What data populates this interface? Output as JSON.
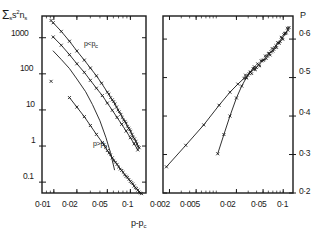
{
  "figure": {
    "type": "scientific-figure",
    "panels": 2,
    "background": "#ffffff",
    "ink": "#1a1a1a"
  },
  "left_panel": {
    "ylabel_sigma": "Σ",
    "ylabel_sigma_sub": "s",
    "ylabel_rest": "s",
    "ylabel_sup": "2",
    "ylabel_n": "n",
    "ylabel_n_sub": "s",
    "ylabel_full": "Σs s²nₛ",
    "xlabel": "p-p",
    "xlabel_sub": "c",
    "y_ticks": [
      "1000",
      "100",
      "10",
      "1",
      "0.1"
    ],
    "x_ticks": [
      "0·01",
      "0·02",
      "0·05",
      "0·1"
    ],
    "annotations": [
      "p<p",
      "p>p"
    ],
    "annotation_sub": "c",
    "annotation_low_label": "p<p",
    "annotation_high_label": "p>p"
  },
  "right_panel": {
    "ylabel": "P",
    "y_ticks": [
      "0·6",
      "0·5",
      "0·4",
      "0·3",
      "0·2"
    ],
    "x_ticks": [
      "0·002",
      "0·005",
      "0·02",
      "0·05",
      "0·1"
    ]
  },
  "chart_data": [
    {
      "type": "scatter",
      "panel": "left",
      "title": "",
      "xlabel": "p-p_c",
      "ylabel": "Σ_s s² n_s",
      "xscale": "log",
      "yscale": "log",
      "xlim": [
        0.007,
        0.16
      ],
      "ylim": [
        0.05,
        4000
      ],
      "x_ticks": [
        0.01,
        0.02,
        0.05,
        0.1
      ],
      "x_ticklabels": [
        "0·01",
        "0·02",
        "0·05",
        "0·1"
      ],
      "y_ticks": [
        1000,
        100,
        10,
        1,
        0.1
      ],
      "y_ticklabels": [
        "1000",
        "100",
        "10",
        "1",
        "0·1"
      ],
      "grid": false,
      "legend": false,
      "annotations": [
        {
          "text": "p<p_c",
          "x": 0.032,
          "y": 260
        },
        {
          "text": "p>p_c",
          "x": 0.04,
          "y": 1.3
        }
      ],
      "series": [
        {
          "name": "p<p_c upper branch",
          "marker": "x",
          "line": true,
          "x": [
            0.0098,
            0.0125,
            0.016,
            0.02,
            0.025,
            0.03,
            0.036,
            0.042,
            0.05,
            0.058,
            0.066,
            0.075,
            0.085,
            0.095,
            0.105,
            0.118,
            0.13
          ],
          "y": [
            2600,
            1500,
            800,
            430,
            240,
            145,
            88,
            55,
            31,
            19,
            12,
            7.5,
            4.8,
            3.1,
            2.1,
            1.35,
            0.9
          ]
        },
        {
          "name": "p<p_c middle branch",
          "marker": "x",
          "line": true,
          "x": [
            0.0098,
            0.0125,
            0.016,
            0.02,
            0.025,
            0.03,
            0.036,
            0.043,
            0.05,
            0.058,
            0.067,
            0.077,
            0.088,
            0.1,
            0.112,
            0.125
          ],
          "y": [
            1050,
            620,
            340,
            190,
            110,
            66,
            40,
            25,
            15.5,
            9.8,
            6.2,
            4.0,
            2.6,
            1.7,
            1.15,
            0.78
          ]
        },
        {
          "name": "p<p_c lower curve",
          "marker": "none",
          "line": true,
          "x": [
            0.0098,
            0.0125,
            0.016,
            0.02,
            0.026,
            0.032,
            0.04,
            0.048,
            0.055,
            0.062
          ],
          "y": [
            430,
            250,
            140,
            72,
            32,
            14,
            5.0,
            1.7,
            0.65,
            0.22
          ]
        },
        {
          "name": "p>p_c branch",
          "marker": "x",
          "line": true,
          "x": [
            0.016,
            0.02,
            0.025,
            0.03,
            0.036,
            0.043,
            0.05,
            0.058,
            0.067,
            0.077,
            0.088,
            0.1,
            0.112,
            0.125,
            0.14
          ],
          "y": [
            22,
            12,
            6.5,
            3.7,
            2.1,
            1.25,
            0.75,
            0.47,
            0.31,
            0.21,
            0.145,
            0.105,
            0.078,
            0.06,
            0.048
          ]
        },
        {
          "name": "isolated points",
          "marker": "x",
          "line": false,
          "x": [
            0.0092,
            0.0092
          ],
          "y": [
            3000,
            62
          ]
        }
      ]
    },
    {
      "type": "scatter",
      "panel": "right",
      "title": "",
      "xlabel": "p-p_c",
      "ylabel": "P",
      "xscale": "log",
      "yscale": "linear",
      "xlim": [
        0.0016,
        0.14
      ],
      "ylim": [
        0.2,
        0.66
      ],
      "x_ticks": [
        0.002,
        0.005,
        0.02,
        0.05,
        0.1
      ],
      "x_ticklabels": [
        "0·002",
        "0·005",
        "0·02",
        "0·05",
        "0·1"
      ],
      "y_ticks": [
        0.6,
        0.5,
        0.4,
        0.3,
        0.2
      ],
      "y_ticklabels": [
        "0·6",
        "0·5",
        "0·4",
        "0·3",
        "0·2"
      ],
      "grid": false,
      "legend": false,
      "series": [
        {
          "name": "main branch",
          "marker": "x",
          "line": true,
          "x": [
            0.0018,
            0.0035,
            0.0065,
            0.011,
            0.016,
            0.021,
            0.026,
            0.031,
            0.037,
            0.043,
            0.05,
            0.058,
            0.066,
            0.075,
            0.085,
            0.096,
            0.108,
            0.122
          ],
          "y": [
            0.268,
            0.324,
            0.377,
            0.428,
            0.462,
            0.483,
            0.498,
            0.51,
            0.522,
            0.533,
            0.545,
            0.556,
            0.567,
            0.578,
            0.59,
            0.602,
            0.615,
            0.63
          ]
        },
        {
          "name": "steep branch",
          "marker": "x",
          "line": true,
          "x": [
            0.0105,
            0.013,
            0.016,
            0.02,
            0.024,
            0.028,
            0.032,
            0.037
          ],
          "y": [
            0.302,
            0.352,
            0.4,
            0.447,
            0.478,
            0.499,
            0.514,
            0.528
          ]
        }
      ]
    }
  ]
}
